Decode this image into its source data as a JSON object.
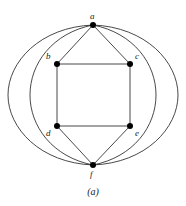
{
  "figure": {
    "caption": "(a)",
    "width": 186,
    "height": 206,
    "background_color": "#ffffff",
    "stroke_color": "#1a1a1a",
    "vertex_fill_color": "#000000"
  },
  "graph": {
    "vertices": [
      {
        "id": "a",
        "label": "a",
        "x": 93,
        "y": 25,
        "label_dx": -3,
        "label_dy": -13,
        "radius": 3.0
      },
      {
        "id": "b",
        "label": "b",
        "x": 57,
        "y": 64,
        "label_dx": -11,
        "label_dy": -12,
        "radius": 3.0
      },
      {
        "id": "c",
        "label": "c",
        "x": 130,
        "y": 64,
        "label_dx": 5,
        "label_dy": -12,
        "radius": 3.0
      },
      {
        "id": "d",
        "label": "d",
        "x": 57,
        "y": 126,
        "label_dx": -11,
        "label_dy": 3,
        "radius": 3.0
      },
      {
        "id": "e",
        "label": "e",
        "x": 130,
        "y": 126,
        "label_dx": 5,
        "label_dy": 3,
        "radius": 3.0
      },
      {
        "id": "f",
        "label": "f",
        "x": 93,
        "y": 165,
        "label_dx": -3,
        "label_dy": 5,
        "radius": 3.0
      }
    ],
    "straight_edges": [
      {
        "from": "a",
        "to": "b",
        "name": "edge-a-b"
      },
      {
        "from": "a",
        "to": "c",
        "name": "edge-a-c"
      },
      {
        "from": "b",
        "to": "c",
        "name": "edge-b-c"
      },
      {
        "from": "b",
        "to": "d",
        "name": "edge-b-d"
      },
      {
        "from": "c",
        "to": "e",
        "name": "edge-c-e"
      },
      {
        "from": "d",
        "to": "e",
        "name": "edge-d-e"
      },
      {
        "from": "d",
        "to": "f",
        "name": "edge-d-f"
      },
      {
        "from": "e",
        "to": "f",
        "name": "edge-e-f"
      }
    ],
    "curved_edges": [
      {
        "name": "arc-a-f-outer-left",
        "from": "a",
        "to": "f",
        "path": "M 93 25 C 40 27 8 62 8 95 C 8 128 40 163 93 165"
      },
      {
        "name": "arc-a-f-inner-left",
        "from": "a",
        "to": "f",
        "path": "M 93 25 C 52 33 30 64 30 95 C 30 126 52 157 93 165"
      },
      {
        "name": "arc-a-f-inner-right",
        "from": "a",
        "to": "f",
        "path": "M 93 25 C 134 33 156 64 156 95 C 156 126 134 157 93 165"
      },
      {
        "name": "arc-a-f-outer-right",
        "from": "a",
        "to": "f",
        "path": "M 93 25 C 146 27 178 62 178 95 C 178 128 146 163 93 165"
      }
    ],
    "stroke_width": 0.8
  }
}
